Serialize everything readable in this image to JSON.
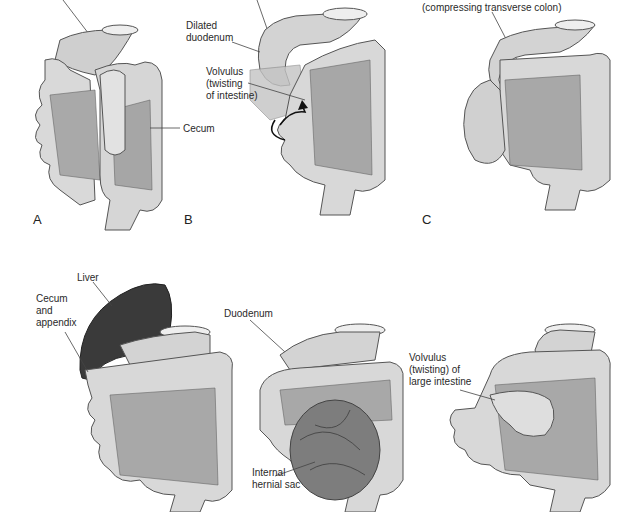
{
  "figure": {
    "colors": {
      "bowel_light": "#dcdcdc",
      "bowel_mid": "#bdbdbd",
      "bowel_outline": "#555555",
      "mesentery": "#a8a8a8",
      "mesentery_dark": "#8a8a8a",
      "liver": "#3a3a3a",
      "hernia_sac": "#7d7d7d",
      "label_text": "#2a2a2a"
    },
    "panels": [
      {
        "id": "A",
        "letter": "A",
        "labels": [
          "Cecum"
        ]
      },
      {
        "id": "B",
        "letter": "B",
        "labels": [
          "Dilated\nduodenum",
          "Volvulus\n(twisting\nof intestine)"
        ]
      },
      {
        "id": "C",
        "letter": "C",
        "labels": [
          "(compressing transverse colon)"
        ]
      },
      {
        "id": "D",
        "letter": "",
        "labels": [
          "Liver",
          "Cecum\nand\nappendix"
        ]
      },
      {
        "id": "E",
        "letter": "",
        "labels": [
          "Duodenum",
          "Internal\nhernial sac"
        ]
      },
      {
        "id": "F",
        "letter": "",
        "labels": [
          "Volvulus\n(twisting) of\nlarge intestine"
        ]
      }
    ]
  }
}
